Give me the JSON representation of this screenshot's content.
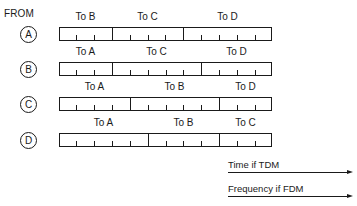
{
  "header": {
    "from_label": "FROM"
  },
  "bar_geometry": {
    "left": 59,
    "right": 272
  },
  "rows": [
    {
      "source": "A",
      "circle_top": 26,
      "bar_top": 27,
      "label_top": 11,
      "segments": [
        {
          "label": "To B",
          "start": 59,
          "end": 112,
          "ticks": [
            76,
            94
          ]
        },
        {
          "label": "To C",
          "start": 112,
          "end": 183,
          "ticks": [
            130,
            148,
            165
          ]
        },
        {
          "label": "To D",
          "start": 183,
          "end": 272,
          "ticks": [
            201,
            219,
            237,
            255
          ]
        }
      ]
    },
    {
      "source": "B",
      "circle_top": 61,
      "bar_top": 62,
      "label_top": 46,
      "segments": [
        {
          "label": "To A",
          "start": 59,
          "end": 112,
          "ticks": [
            76,
            94
          ]
        },
        {
          "label": "To C",
          "start": 112,
          "end": 201,
          "ticks": [
            130,
            148,
            166,
            183
          ]
        },
        {
          "label": "To D",
          "start": 201,
          "end": 272,
          "ticks": [
            219,
            237,
            255
          ]
        }
      ]
    },
    {
      "source": "C",
      "circle_top": 96,
      "bar_top": 97,
      "label_top": 81,
      "segments": [
        {
          "label": "To A",
          "start": 59,
          "end": 130,
          "ticks": [
            76,
            94,
            112
          ]
        },
        {
          "label": "To B",
          "start": 130,
          "end": 219,
          "ticks": [
            148,
            166,
            183,
            201
          ]
        },
        {
          "label": "To D",
          "start": 219,
          "end": 272,
          "ticks": [
            237,
            255
          ]
        }
      ]
    },
    {
      "source": "D",
      "circle_top": 132,
      "bar_top": 133,
      "label_top": 117,
      "segments": [
        {
          "label": "To A",
          "start": 59,
          "end": 148,
          "ticks": [
            76,
            94,
            112,
            130
          ]
        },
        {
          "label": "To B",
          "start": 148,
          "end": 219,
          "ticks": [
            166,
            183,
            201
          ]
        },
        {
          "label": "To C",
          "start": 219,
          "end": 272,
          "ticks": [
            237,
            255
          ]
        }
      ]
    }
  ],
  "axes": [
    {
      "label": "Time if TDM",
      "label_top": 159,
      "arrow_top": 172
    },
    {
      "label": "Frequency if FDM",
      "label_top": 183,
      "arrow_top": 196
    }
  ]
}
